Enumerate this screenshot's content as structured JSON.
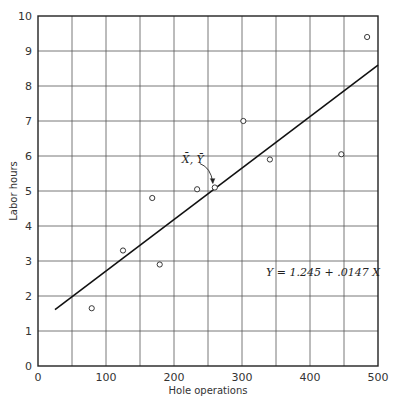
{
  "chart_data": {
    "type": "scatter",
    "title": "",
    "xlabel": "Hole operations",
    "ylabel": "Labor hours",
    "xlim": [
      0,
      500
    ],
    "ylim": [
      0,
      10
    ],
    "xticks": [
      0,
      100,
      200,
      300,
      400,
      500
    ],
    "yticks": [
      0,
      1,
      2,
      3,
      4,
      5,
      6,
      7,
      8,
      9,
      10
    ],
    "grid": true,
    "grid_x_step": 50,
    "grid_y_step": 1,
    "points": [
      {
        "x": 79,
        "y": 1.65
      },
      {
        "x": 125,
        "y": 3.3
      },
      {
        "x": 168,
        "y": 4.8
      },
      {
        "x": 179,
        "y": 2.9
      },
      {
        "x": 234,
        "y": 5.05
      },
      {
        "x": 302,
        "y": 7.0
      },
      {
        "x": 341,
        "y": 5.9
      },
      {
        "x": 446,
        "y": 6.05
      },
      {
        "x": 484,
        "y": 9.4
      }
    ],
    "mean_point": {
      "x": 260,
      "y": 5.1,
      "label": "X̄, Ȳ"
    },
    "regression": {
      "intercept": 1.245,
      "slope": 0.0147,
      "x_start": 25,
      "x_end": 500,
      "label": "Y = 1.245 + .0147 X"
    }
  }
}
